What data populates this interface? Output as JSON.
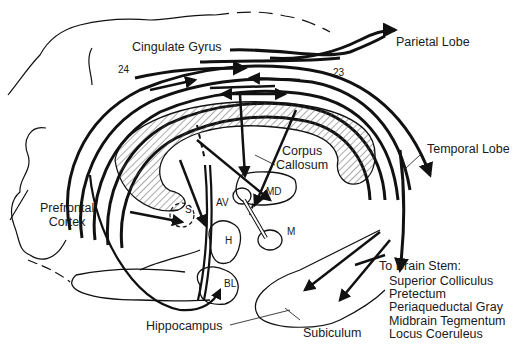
{
  "diagram": {
    "colors": {
      "ink": "#111111",
      "background": "#ffffff",
      "hatch": "#555555"
    },
    "labels": {
      "cingulate_gyrus": "Cingulate Gyrus",
      "parietal_lobe": "Parietal Lobe",
      "area_24": "24",
      "area_23": "23",
      "corpus_callosum_1": "Corpus",
      "corpus_callosum_2": "Callosum",
      "temporal_lobe": "Temporal Lobe",
      "prefrontal_1": "Prefrontal",
      "prefrontal_2": "Cortex",
      "septum": "S",
      "anteroventral": "AV",
      "mediodorsal": "MD",
      "mammillary": "M",
      "hypothalamus": "H",
      "basolateral": "BL",
      "hippocampus": "Hippocampus",
      "subiculum": "Subiculum"
    },
    "brain_stem": {
      "heading": "To Brain Stem:",
      "targets": [
        "Superior Colliculus",
        "Pretectum",
        "Periaqueductal Gray",
        "Midbrain Tegmentum",
        "Locus Coeruleus"
      ]
    }
  }
}
